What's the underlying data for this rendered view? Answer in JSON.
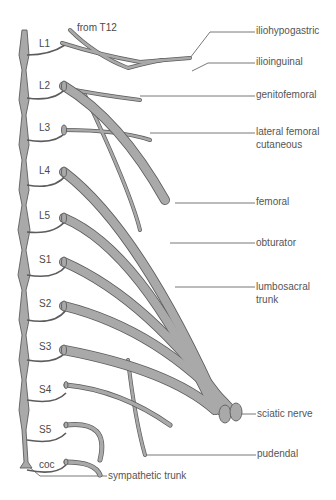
{
  "diagram": {
    "colors": {
      "nerve_fill": "#a9a9a9",
      "nerve_stroke": "#5c5c5c",
      "leader": "#555555",
      "text": "#4a4a4a",
      "background": "#ffffff"
    },
    "root_labels": [
      {
        "id": "L1",
        "text": "L1",
        "x": 41,
        "y": 36
      },
      {
        "id": "L2",
        "text": "L2",
        "x": 41,
        "y": 79
      },
      {
        "id": "L3",
        "text": "L3",
        "x": 41,
        "y": 122
      },
      {
        "id": "L4",
        "text": "L4",
        "x": 41,
        "y": 165
      },
      {
        "id": "L5",
        "text": "L5",
        "x": 41,
        "y": 210
      },
      {
        "id": "S1",
        "text": "S1",
        "x": 41,
        "y": 254
      },
      {
        "id": "S2",
        "text": "S2",
        "x": 41,
        "y": 298
      },
      {
        "id": "S3",
        "text": "S3",
        "x": 41,
        "y": 341
      },
      {
        "id": "S4",
        "text": "S4",
        "x": 41,
        "y": 384
      },
      {
        "id": "S5",
        "text": "S5",
        "x": 41,
        "y": 424
      },
      {
        "id": "coc",
        "text": "coc",
        "x": 41,
        "y": 463
      }
    ],
    "top_label": {
      "text": "from T12",
      "x": 77,
      "y": 22
    },
    "nerve_labels": [
      {
        "id": "iliohypogastric",
        "lines": [
          "iliohypogastric"
        ],
        "x": 256,
        "y": 24
      },
      {
        "id": "ilioinguinal",
        "lines": [
          "ilioinguinal"
        ],
        "x": 256,
        "y": 56
      },
      {
        "id": "genitofemoral",
        "lines": [
          "genitofemoral"
        ],
        "x": 256,
        "y": 89
      },
      {
        "id": "lateral-femoral-cutaneous",
        "lines": [
          "lateral femoral",
          "cutaneous"
        ],
        "x": 256,
        "y": 126
      },
      {
        "id": "femoral",
        "lines": [
          "femoral"
        ],
        "x": 256,
        "y": 195
      },
      {
        "id": "obturator",
        "lines": [
          "obturator"
        ],
        "x": 256,
        "y": 240
      },
      {
        "id": "lumbosacral-trunk",
        "lines": [
          "lumbosacral",
          "trunk"
        ],
        "x": 256,
        "y": 280
      },
      {
        "id": "sciatic-nerve",
        "lines": [
          "sciatic nerve"
        ],
        "x": 257,
        "y": 411
      },
      {
        "id": "pudendal",
        "lines": [
          "pudendal"
        ],
        "x": 257,
        "y": 449
      }
    ],
    "bottom_label": {
      "id": "sympathetic-trunk",
      "text": "sympathetic trunk",
      "x": 108,
      "y": 471
    }
  }
}
